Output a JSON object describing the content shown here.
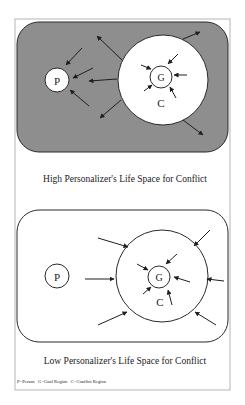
{
  "colors": {
    "background": "#ffffff",
    "frame": "#b5b5b5",
    "high_fill": "#8e8e8e",
    "low_fill": "#ffffff",
    "stroke": "#2a2a2a",
    "circle_fill": "#ffffff"
  },
  "panels": [
    {
      "id": "high",
      "caption": "High Personalizer's Life Space for Conflict",
      "labels": {
        "person": "P",
        "goal": "G",
        "conflict": "C"
      }
    },
    {
      "id": "low",
      "caption": "Low Personalizer's Life Space for Conflict",
      "labels": {
        "person": "P",
        "goal": "G",
        "conflict": "C"
      }
    }
  ],
  "legend": "P=Person   G=Goal Region   C=Conflict Region"
}
